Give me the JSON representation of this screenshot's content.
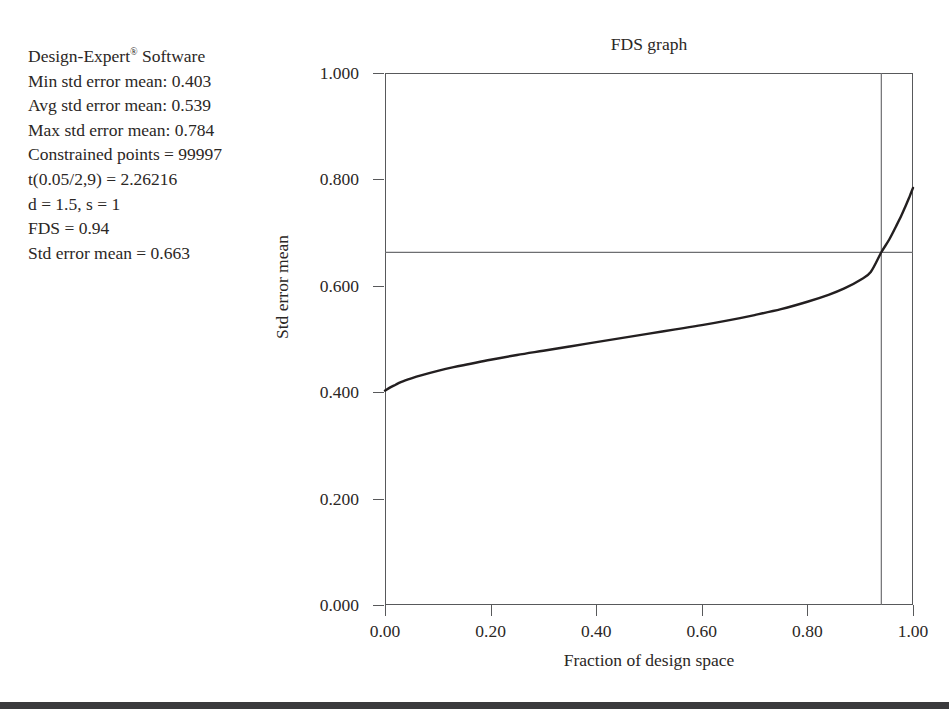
{
  "info": {
    "lines": [
      "Design-Expert® Software",
      "Min std error mean: 0.403",
      "Avg std error mean: 0.539",
      "Max std error mean: 0.784",
      "Constrained points = 99997",
      "t(0.05/2,9) = 2.26216",
      "d = 1.5, s = 1",
      "FDS = 0.94",
      "Std error mean = 0.663"
    ]
  },
  "colors": {
    "curve": "#231f20",
    "axis": "#58595b",
    "reference_line": "#6d6e71",
    "text": "#2b2725",
    "background": "#ffffff",
    "bottom_rule": "#3a3a3c"
  },
  "chart_data": {
    "type": "line",
    "title": "FDS graph",
    "xlabel": "Fraction of design space",
    "ylabel": "Std error mean",
    "xlim": [
      0.0,
      1.0
    ],
    "ylim": [
      0.0,
      1.0
    ],
    "xticks": [
      0.0,
      0.2,
      0.4,
      0.6,
      0.8,
      1.0
    ],
    "xtick_labels": [
      "0.00",
      "0.20",
      "0.40",
      "0.60",
      "0.80",
      "1.00"
    ],
    "yticks": [
      0.0,
      0.2,
      0.4,
      0.6,
      0.8,
      1.0
    ],
    "ytick_labels": [
      "0.000",
      "0.200",
      "0.400",
      "0.600",
      "0.800",
      "1.000"
    ],
    "grid": false,
    "legend": false,
    "series": [
      {
        "name": "Std error mean",
        "x": [
          0.0,
          0.01,
          0.02,
          0.03,
          0.05,
          0.07,
          0.1,
          0.13,
          0.16,
          0.2,
          0.25,
          0.3,
          0.35,
          0.4,
          0.45,
          0.5,
          0.55,
          0.6,
          0.65,
          0.7,
          0.75,
          0.8,
          0.84,
          0.87,
          0.9,
          0.92,
          0.94,
          0.955,
          0.968,
          0.978,
          0.986,
          0.992,
          0.996,
          1.0
        ],
        "y": [
          0.403,
          0.409,
          0.414,
          0.419,
          0.426,
          0.432,
          0.44,
          0.447,
          0.453,
          0.461,
          0.47,
          0.478,
          0.486,
          0.494,
          0.502,
          0.51,
          0.518,
          0.526,
          0.535,
          0.545,
          0.556,
          0.57,
          0.583,
          0.595,
          0.611,
          0.626,
          0.663,
          0.687,
          0.712,
          0.732,
          0.75,
          0.764,
          0.774,
          0.784
        ]
      }
    ],
    "reference_lines": [
      {
        "orientation": "horizontal",
        "value": 0.663,
        "label": "Std error mean = 0.663"
      },
      {
        "orientation": "vertical",
        "value": 0.94,
        "label": "FDS = 0.94"
      }
    ],
    "annotations": {
      "min_std_error_mean": 0.403,
      "avg_std_error_mean": 0.539,
      "max_std_error_mean": 0.784,
      "constrained_points": 99997,
      "t_value": 2.26216,
      "d": 1.5,
      "s": 1,
      "fds": 0.94,
      "std_error_mean": 0.663
    }
  }
}
